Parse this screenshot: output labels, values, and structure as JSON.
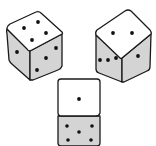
{
  "scene": {
    "description": "Three dice drawn in black ink with gray shaded side faces",
    "colors": {
      "face_light": "#ffffff",
      "face_shaded": "#d4d4d4",
      "outline": "#1a1a1a",
      "pip": "#111111"
    },
    "dice": [
      {
        "name": "left-die",
        "top_face_pips": 4,
        "left_face_pips": 1,
        "right_face_pips": 3
      },
      {
        "name": "right-die",
        "top_face_pips": 2,
        "left_face_pips": 3,
        "right_face_pips": 1
      },
      {
        "name": "bottom-die",
        "front_face_pips": 1,
        "lower_face_pips": 5
      }
    ]
  }
}
